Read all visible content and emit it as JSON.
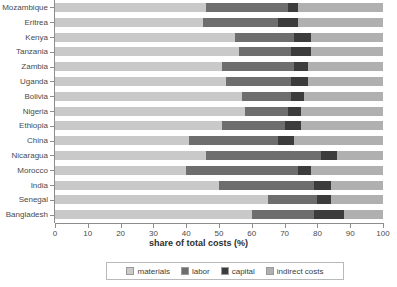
{
  "chart_data": {
    "type": "bar",
    "orientation": "horizontal",
    "stacked": true,
    "normalized": true,
    "title": "",
    "xlabel": "share of total costs (%)",
    "ylabel": "",
    "xlim": [
      0,
      100
    ],
    "xticks": [
      0,
      10,
      20,
      30,
      40,
      50,
      60,
      70,
      80,
      90,
      100
    ],
    "xticklabels": [
      "0",
      "10",
      "20",
      "30",
      "40",
      "50",
      "60",
      "70",
      "80",
      "90",
      "100"
    ],
    "grid": false,
    "legend_position": "bottom",
    "legend_entries": [
      "materials",
      "labor",
      "capital",
      "indirect costs"
    ],
    "categories": [
      "Mozambique",
      "Eritrea",
      "Kenya",
      "Tanzania",
      "Zambia",
      "Uganda",
      "Bolivia",
      "Nigeria",
      "Ethiopia",
      "China",
      "Nicaragua",
      "Morocco",
      "India",
      "Senegal",
      "Bangladesh"
    ],
    "series": [
      {
        "name": "materials",
        "color": "#c9c9c9",
        "values": [
          46,
          45,
          55,
          56,
          51,
          52,
          57,
          58,
          51,
          41,
          46,
          40,
          50,
          65,
          60
        ]
      },
      {
        "name": "labor",
        "color": "#6e6e6e",
        "values": [
          25,
          23,
          18,
          16,
          22,
          20,
          15,
          13,
          19,
          27,
          35,
          34,
          29,
          15,
          19
        ]
      },
      {
        "name": "capital",
        "color": "#3c3c3c",
        "values": [
          3,
          6,
          5,
          6,
          4,
          5,
          4,
          4,
          5,
          5,
          5,
          4,
          5,
          4,
          9
        ]
      },
      {
        "name": "indirect costs",
        "color": "#b0b0b0",
        "values": [
          26,
          26,
          22,
          22,
          23,
          23,
          24,
          25,
          25,
          27,
          14,
          22,
          16,
          16,
          12
        ]
      }
    ]
  },
  "axis": {
    "x_title": "share of total costs (%)"
  },
  "legend": {
    "items": [
      {
        "label": "materials",
        "color": "#c9c9c9"
      },
      {
        "label": "labor",
        "color": "#6e6e6e"
      },
      {
        "label": "capital",
        "color": "#3c3c3c"
      },
      {
        "label": "indirect costs",
        "color": "#b0b0b0"
      }
    ]
  }
}
